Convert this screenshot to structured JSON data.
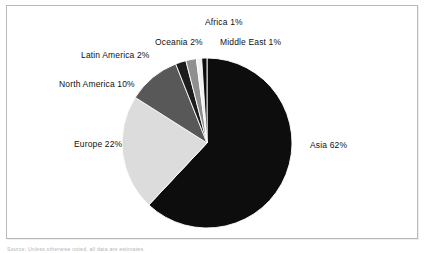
{
  "figure": {
    "background_color": "#ffffff",
    "frame_color": "#b9b9b9",
    "caption_partial": "Source: Unless otherwise noted, all data are estimates."
  },
  "chart_data": {
    "type": "pie",
    "title": "",
    "subtitle": "",
    "xlabel": "",
    "ylabel": "",
    "legend_position": "none",
    "grid": false,
    "labels_show_percent": true,
    "start_angle_deg": -90,
    "direction": "clockwise",
    "categories": [
      "Asia",
      "Europe",
      "North America",
      "Latin America",
      "Oceania",
      "Africa",
      "Middle East"
    ],
    "values": [
      62,
      22,
      10,
      2,
      2,
      1,
      1
    ],
    "units": "percent",
    "colors": [
      "#0d0d0d",
      "#dcdcdc",
      "#585858",
      "#1c1c1c",
      "#8f8f8f",
      "#f2f2f2",
      "#0d0d0d"
    ],
    "slices": [
      {
        "name": "Asia",
        "value": 62,
        "label": "Asia 62%",
        "color": "#0d0d0d"
      },
      {
        "name": "Europe",
        "value": 22,
        "label": "Europe 22%",
        "color": "#dcdcdc"
      },
      {
        "name": "North America",
        "value": 10,
        "label": "North America 10%",
        "color": "#585858"
      },
      {
        "name": "Latin America",
        "value": 2,
        "label": "Latin America 2%",
        "color": "#1c1c1c"
      },
      {
        "name": "Oceania",
        "value": 2,
        "label": "Oceania 2%",
        "color": "#8f8f8f"
      },
      {
        "name": "Africa",
        "value": 1,
        "label": "Africa 1%",
        "color": "#f2f2f2"
      },
      {
        "name": "Middle East",
        "value": 1,
        "label": "Middle East 1%",
        "color": "#0d0d0d"
      }
    ]
  },
  "labels": {
    "africa": {
      "name": "Africa",
      "pct": "1%",
      "text": "Africa 1%"
    },
    "middle_east": {
      "name": "Middle East",
      "pct": "1%",
      "text": "Middle East 1%"
    },
    "oceania": {
      "name": "Oceania",
      "pct": "2%",
      "text": "Oceania 2%"
    },
    "latin_america": {
      "name": "Latin America",
      "pct": "2%",
      "text": "Latin America 2%"
    },
    "north_america": {
      "name": "North America",
      "pct": "10%",
      "text": "North America 10%"
    },
    "europe": {
      "name": "Europe",
      "pct": "22%",
      "text": "Europe 22%"
    },
    "asia": {
      "name": "Asia",
      "pct": "62%",
      "text": "Asia 62%"
    }
  }
}
